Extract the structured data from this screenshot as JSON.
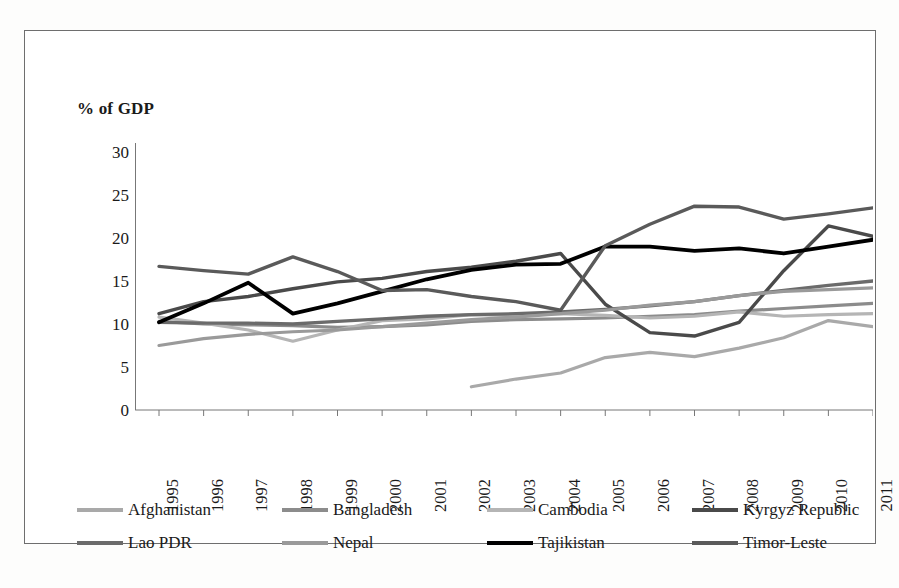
{
  "figure": {
    "axis_unit_label": "% of GDP",
    "legend_position": "bottom"
  },
  "chart_data": {
    "type": "line",
    "title": "",
    "subtitle": "",
    "xlabel": "",
    "ylabel": "% of GDP",
    "ylim": [
      0,
      30
    ],
    "ytick_values": [
      0,
      5,
      10,
      15,
      20,
      25,
      30
    ],
    "ytick_labels": [
      "0",
      "5",
      "10",
      "15",
      "20",
      "25",
      "30"
    ],
    "grid": false,
    "legend_position": "bottom",
    "categories": [
      "1995",
      "1996",
      "1997",
      "1998",
      "1999",
      "2000",
      "2001",
      "2002",
      "2003",
      "2004",
      "2005",
      "2006",
      "2007",
      "2008",
      "2009",
      "2010",
      "2011"
    ],
    "x": [
      1995,
      1996,
      1997,
      1998,
      1999,
      2000,
      2001,
      2002,
      2003,
      2004,
      2005,
      2006,
      2007,
      2008,
      2009,
      2010,
      2011
    ],
    "series": [
      {
        "name": "Afghanistan",
        "color": "#a9a9a9",
        "width": 3.2,
        "values": [
          null,
          null,
          null,
          null,
          null,
          null,
          null,
          2.7,
          3.6,
          4.3,
          6.1,
          6.7,
          6.2,
          7.2,
          8.4,
          10.4,
          9.7
        ]
      },
      {
        "name": "Bangladesh",
        "color": "#8c8c8c",
        "width": 3.2,
        "values": [
          10.3,
          10.0,
          9.9,
          9.8,
          9.6,
          9.7,
          9.9,
          10.3,
          10.5,
          10.6,
          10.7,
          10.9,
          11.1,
          11.5,
          11.8,
          12.1,
          12.4
        ]
      },
      {
        "name": "Cambodia",
        "color": "#b5b5b5",
        "width": 3.2,
        "values": [
          10.8,
          10.1,
          9.3,
          8.0,
          9.3,
          10.4,
          10.6,
          11.1,
          11.0,
          11.2,
          11.0,
          10.7,
          10.9,
          11.4,
          10.9,
          11.1,
          11.2
        ]
      },
      {
        "name": "Kyrgyz Republic",
        "color": "#4a4a4a",
        "width": 3.4,
        "values": [
          11.2,
          12.6,
          13.2,
          14.1,
          14.9,
          15.3,
          16.1,
          16.6,
          17.3,
          18.2,
          12.3,
          9.0,
          8.6,
          10.2,
          16.2,
          21.4,
          20.2
        ]
      },
      {
        "name": "Lao PDR",
        "color": "#6b6b6b",
        "width": 3.3,
        "values": [
          10.2,
          10.1,
          10.1,
          10.0,
          10.3,
          10.6,
          10.9,
          11.1,
          11.2,
          11.4,
          11.7,
          12.1,
          12.6,
          13.3,
          13.9,
          14.5,
          15.0
        ]
      },
      {
        "name": "Nepal",
        "color": "#9a9a9a",
        "width": 3.2,
        "values": [
          7.5,
          8.3,
          8.8,
          9.1,
          9.3,
          9.7,
          10.1,
          10.5,
          10.8,
          11.2,
          11.6,
          12.2,
          12.6,
          13.3,
          13.8,
          14.0,
          14.2
        ]
      },
      {
        "name": "Tajikistan",
        "color": "#000000",
        "width": 3.8,
        "values": [
          10.2,
          12.4,
          14.8,
          11.2,
          12.4,
          13.8,
          15.2,
          16.3,
          16.9,
          17.0,
          19.0,
          19.0,
          18.5,
          18.8,
          18.2,
          19.0,
          19.8
        ]
      },
      {
        "name": "Timor-Leste",
        "color": "#5a5a5a",
        "width": 3.4,
        "values": [
          16.7,
          16.2,
          15.8,
          17.8,
          16.1,
          13.9,
          14.0,
          13.2,
          12.6,
          11.6,
          19.1,
          21.6,
          23.7,
          23.6,
          22.2,
          22.8,
          23.5
        ]
      }
    ]
  },
  "legend": {
    "items": [
      {
        "label": "Afghanistan",
        "color": "#a9a9a9"
      },
      {
        "label": "Bangladesh",
        "color": "#8c8c8c"
      },
      {
        "label": "Cambodia",
        "color": "#b5b5b5"
      },
      {
        "label": "Kyrgyz Republic",
        "color": "#4a4a4a"
      },
      {
        "label": "Lao PDR",
        "color": "#6b6b6b"
      },
      {
        "label": "Nepal",
        "color": "#9a9a9a"
      },
      {
        "label": "Tajikistan",
        "color": "#000000"
      },
      {
        "label": "Timor-Leste",
        "color": "#5a5a5a"
      }
    ]
  }
}
